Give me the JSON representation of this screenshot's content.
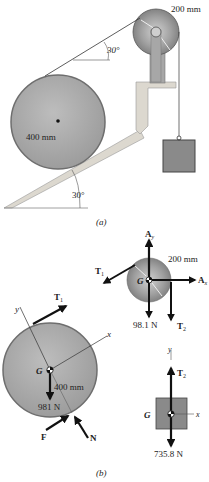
{
  "figure_a": {
    "caption": "(a)",
    "pulley_radius_label": "200 mm",
    "drum_radius_label": "400 mm",
    "cable_angle_label": "30°",
    "incline_angle_label": "30°"
  },
  "figure_b": {
    "caption": "(b)",
    "pulley_fbd": {
      "ay_label": "A",
      "ay_sub": "y",
      "ax_label": "A",
      "ax_sub": "x",
      "t1_label": "T",
      "t1_sub": "1",
      "t2_label": "T",
      "t2_sub": "2",
      "g_label": "G",
      "radius_label": "200 mm",
      "weight_label": "98.1 N"
    },
    "drum_fbd": {
      "t1_label": "T",
      "t1_sub": "1",
      "g_label": "G",
      "y_axis_label": "y",
      "x_axis_label": "x",
      "radius_label": "400 mm",
      "weight_label": "981 N",
      "f_label": "F",
      "n_label": "N"
    },
    "block_fbd": {
      "t2_label": "T",
      "t2_sub": "2",
      "g_label": "G",
      "y_axis_label": "y",
      "x_axis_label": "x",
      "weight_label": "735.8 N"
    }
  },
  "colors": {
    "disk_fill": "#a9a9a9",
    "disk_edge": "#6e6e6e",
    "support_fill": "#d9d6cf",
    "block_fill": "#8a8a8a",
    "arrow": "#111111"
  }
}
